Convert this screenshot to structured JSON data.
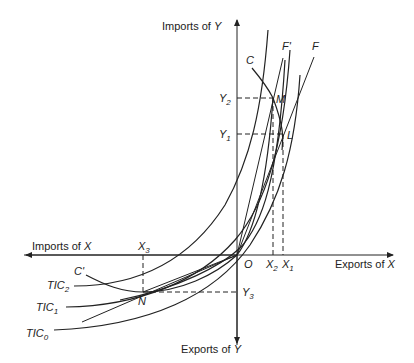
{
  "diagram": {
    "axes": {
      "y_top_label": "Imports of ",
      "y_top_var": "Y",
      "y_bottom_label": "Exports of ",
      "y_bottom_var": "Y",
      "x_left_label": "Imports of ",
      "x_left_var": "X",
      "x_right_label": "Exports of ",
      "x_right_var": "X",
      "origin": "O"
    },
    "curves": {
      "C": "C",
      "C_prime": "C'",
      "F": "F",
      "F_prime": "F'",
      "tic2": "TIC",
      "tic2_sub": "2",
      "tic1": "TIC",
      "tic1_sub": "1",
      "tic0": "TIC",
      "tic0_sub": "0"
    },
    "points": {
      "M": "M",
      "L": "L",
      "N": "N"
    },
    "ticks": {
      "Y2": "Y",
      "Y2_sub": "2",
      "Y1": "Y",
      "Y1_sub": "1",
      "Y3": "Y",
      "Y3_sub": "3",
      "X1": "X",
      "X1_sub": "1",
      "X2": "X",
      "X2_sub": "2",
      "X3": "X",
      "X3_sub": "3"
    }
  }
}
